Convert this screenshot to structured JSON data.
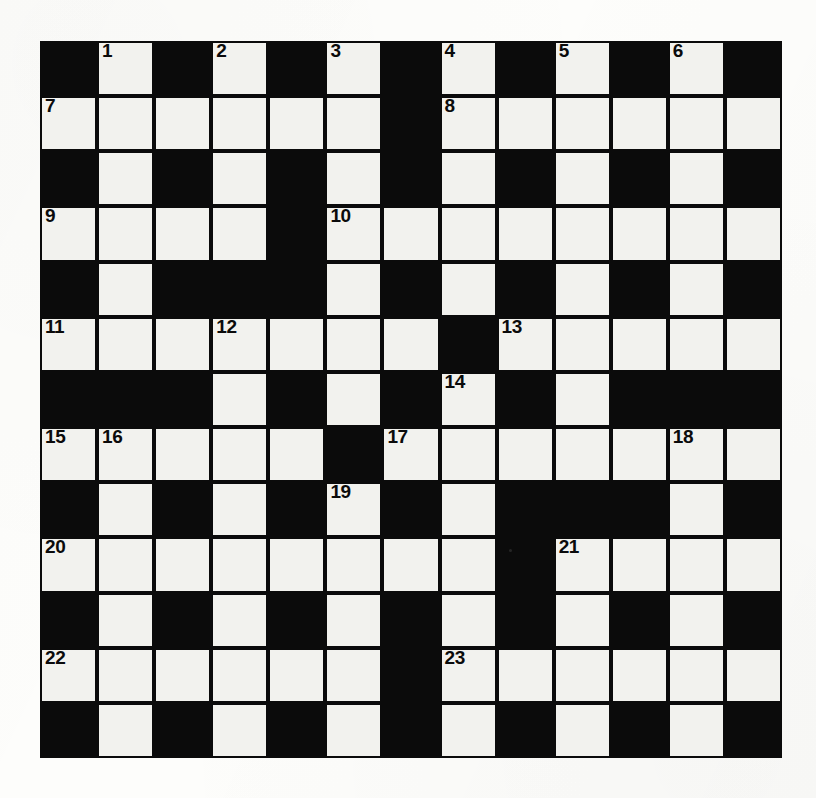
{
  "puzzle": {
    "type": "crossword-grid",
    "title": "Crossword Puzzle Grid",
    "columns": 13,
    "rows": 13,
    "cell_size_px": 57,
    "colors": {
      "block": "#0b0b0b",
      "open_cell": "#f2f2ee",
      "page_background": "#fdfdfb",
      "clue_number": "#0b0b0b"
    },
    "highest_clue_number": 23,
    "clue_numbers": [
      1,
      2,
      3,
      4,
      5,
      6,
      7,
      8,
      9,
      10,
      11,
      12,
      13,
      14,
      15,
      16,
      17,
      18,
      19,
      20,
      21,
      22,
      23
    ],
    "grid": [
      [
        "block",
        "open",
        "block",
        "open",
        "block",
        "open",
        "block",
        "open",
        "block",
        "open",
        "block",
        "open",
        "block"
      ],
      [
        "open",
        "open",
        "open",
        "open",
        "open",
        "open",
        "block",
        "open",
        "open",
        "open",
        "open",
        "open",
        "open"
      ],
      [
        "block",
        "open",
        "block",
        "open",
        "block",
        "open",
        "block",
        "open",
        "block",
        "open",
        "block",
        "open",
        "block"
      ],
      [
        "open",
        "open",
        "open",
        "open",
        "block",
        "open",
        "open",
        "open",
        "open",
        "open",
        "open",
        "open",
        "open"
      ],
      [
        "block",
        "open",
        "block",
        "block",
        "block",
        "open",
        "block",
        "open",
        "block",
        "open",
        "block",
        "open",
        "block"
      ],
      [
        "open",
        "open",
        "open",
        "open",
        "open",
        "open",
        "open",
        "block",
        "open",
        "open",
        "open",
        "open",
        "open"
      ],
      [
        "block",
        "block",
        "block",
        "open",
        "block",
        "open",
        "block",
        "open",
        "block",
        "open",
        "block",
        "block",
        "block"
      ],
      [
        "open",
        "open",
        "open",
        "open",
        "open",
        "block",
        "open",
        "open",
        "open",
        "open",
        "open",
        "open",
        "open"
      ],
      [
        "block",
        "open",
        "block",
        "open",
        "block",
        "open",
        "block",
        "open",
        "block",
        "block",
        "block",
        "open",
        "block"
      ],
      [
        "open",
        "open",
        "open",
        "open",
        "open",
        "open",
        "open",
        "open",
        "block",
        "open",
        "open",
        "open",
        "open"
      ],
      [
        "block",
        "open",
        "block",
        "open",
        "block",
        "open",
        "block",
        "open",
        "block",
        "open",
        "block",
        "open",
        "block"
      ],
      [
        "open",
        "open",
        "open",
        "open",
        "open",
        "open",
        "block",
        "open",
        "open",
        "open",
        "open",
        "open",
        "open"
      ],
      [
        "block",
        "open",
        "block",
        "open",
        "block",
        "open",
        "block",
        "open",
        "block",
        "open",
        "block",
        "open",
        "block"
      ]
    ],
    "numbered_cells": [
      {
        "number": "1",
        "row": 0,
        "col": 1
      },
      {
        "number": "2",
        "row": 0,
        "col": 3
      },
      {
        "number": "3",
        "row": 0,
        "col": 5
      },
      {
        "number": "4",
        "row": 0,
        "col": 7
      },
      {
        "number": "5",
        "row": 0,
        "col": 9
      },
      {
        "number": "6",
        "row": 0,
        "col": 11
      },
      {
        "number": "7",
        "row": 1,
        "col": 0
      },
      {
        "number": "8",
        "row": 1,
        "col": 7
      },
      {
        "number": "9",
        "row": 3,
        "col": 0
      },
      {
        "number": "10",
        "row": 3,
        "col": 5
      },
      {
        "number": "11",
        "row": 5,
        "col": 0
      },
      {
        "number": "12",
        "row": 5,
        "col": 3
      },
      {
        "number": "13",
        "row": 5,
        "col": 8
      },
      {
        "number": "14",
        "row": 6,
        "col": 7
      },
      {
        "number": "15",
        "row": 7,
        "col": 0
      },
      {
        "number": "16",
        "row": 7,
        "col": 1
      },
      {
        "number": "17",
        "row": 7,
        "col": 6
      },
      {
        "number": "18",
        "row": 7,
        "col": 11
      },
      {
        "number": "19",
        "row": 8,
        "col": 5
      },
      {
        "number": "20",
        "row": 9,
        "col": 0
      },
      {
        "number": "21",
        "row": 9,
        "col": 9
      },
      {
        "number": "22",
        "row": 11,
        "col": 0
      },
      {
        "number": "23",
        "row": 11,
        "col": 7
      }
    ],
    "specks": [
      {
        "x": 509,
        "y": 549
      }
    ]
  }
}
